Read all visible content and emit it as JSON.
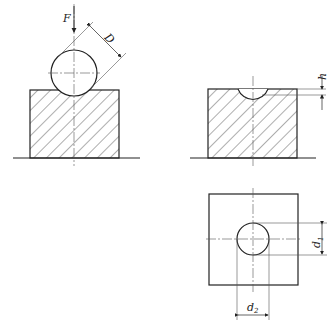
{
  "figure": {
    "views": [
      {
        "id": "ball-loading",
        "description": "Ball pressed into specimen under force"
      },
      {
        "id": "indentation-section",
        "description": "Section of specimen showing indentation depth"
      },
      {
        "id": "indentation-plan",
        "description": "Top view of indentation with diameters"
      }
    ],
    "labels": {
      "force": "F",
      "ball_diameter": "D",
      "depth": "h",
      "d1_main": "d",
      "d1_sub": "1",
      "d2_main": "d",
      "d2_sub": "2"
    },
    "colors": {
      "line": "#222222",
      "thin": "#555555",
      "background": "#ffffff"
    }
  }
}
